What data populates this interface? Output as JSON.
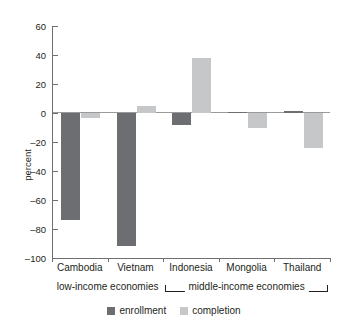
{
  "chart_data": {
    "type": "bar",
    "title": "",
    "subtitle": "",
    "xlabel": "",
    "ylabel": "percent",
    "ylim": [
      -100,
      60
    ],
    "yticks": [
      60,
      40,
      20,
      0,
      -20,
      -40,
      -60,
      -80,
      -100
    ],
    "ytick_labels": [
      "60",
      "40",
      "20",
      "0",
      "–20",
      "–40",
      "–60",
      "–80",
      "–100"
    ],
    "grid": false,
    "legend_position": "bottom",
    "categories": [
      "Cambodia",
      "Vietnam",
      "Indonesia",
      "Mongolia",
      "Thailand"
    ],
    "series": [
      {
        "name": "enrollment",
        "color": "#6d6e71",
        "values": [
          -74,
          -92,
          -8,
          1,
          1.5
        ]
      },
      {
        "name": "completion",
        "color": "#c6c7c9",
        "values": [
          -3.5,
          4.5,
          38,
          -10,
          -24
        ]
      }
    ],
    "group_brackets": [
      {
        "label": "low-income economies",
        "categories": [
          "Cambodia",
          "Vietnam"
        ]
      },
      {
        "label": "middle-income economies",
        "categories": [
          "Indonesia",
          "Mongolia",
          "Thailand"
        ]
      }
    ]
  },
  "legend": {
    "items": [
      {
        "label": "enrollment"
      },
      {
        "label": "completion"
      }
    ]
  },
  "axes": {
    "y_title": "percent"
  }
}
